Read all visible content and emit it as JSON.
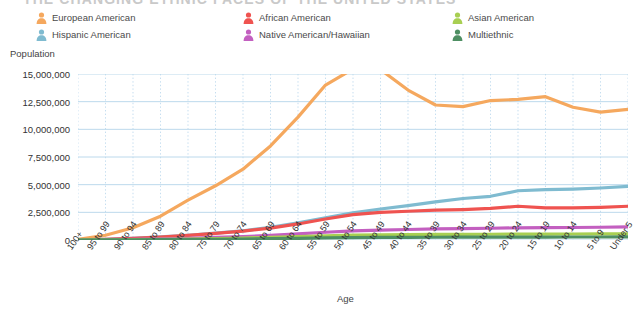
{
  "title": "THE CHANGING ETHNIC FACES OF THE UNITED STATES",
  "axis": {
    "y_title": "Population",
    "x_title": "Age"
  },
  "legend": {
    "icon_name": "person-icon",
    "columns": [
      [
        {
          "label": "European American",
          "color": "#F5A85E"
        },
        {
          "label": "Hispanic American",
          "color": "#7FBBD0"
        }
      ],
      [
        {
          "label": "African American",
          "color": "#EF5350"
        },
        {
          "label": "Native American/Hawaiian",
          "color": "#C35FC0"
        }
      ],
      [
        {
          "label": "Asian American",
          "color": "#A8CF52"
        },
        {
          "label": "Multiethnic",
          "color": "#4E8F63"
        }
      ]
    ]
  },
  "chart_data": {
    "type": "line",
    "title": "THE CHANGING ETHNIC FACES OF THE UNITED STATES",
    "xlabel": "Age",
    "ylabel": "Population",
    "ylim": [
      0,
      15000000
    ],
    "yticks": [
      0,
      2500000,
      5000000,
      7500000,
      10000000,
      12500000,
      15000000
    ],
    "ytick_labels": [
      "0",
      "2,500,000",
      "5,000,000",
      "7,500,000",
      "10,000,000",
      "12,500,000",
      "15,000,000"
    ],
    "grid": true,
    "legend_position": "top",
    "categories": [
      "100+",
      "95 to 99",
      "90 to 94",
      "85 to 89",
      "80 to 84",
      "75 to 79",
      "70 to 74",
      "65 to 69",
      "60 to 64",
      "55 to 59",
      "50 to 54",
      "45 to 49",
      "40 to 44",
      "35 to 39",
      "30 to 34",
      "25 to 29",
      "20 to 24",
      "15 to 19",
      "10 to 14",
      "5 to 9",
      "Under 5"
    ],
    "series": [
      {
        "name": "European American",
        "color": "#F5A85E",
        "values": [
          60000,
          430000,
          1100000,
          2150000,
          3600000,
          4900000,
          6400000,
          8500000,
          11100000,
          14000000,
          15450000,
          15400000,
          13550000,
          12200000,
          12050000,
          12600000,
          12700000,
          12950000,
          12000000,
          11550000,
          11800000
        ]
      },
      {
        "name": "Hispanic American",
        "color": "#7FBBD0",
        "values": [
          15000,
          70000,
          150000,
          280000,
          430000,
          620000,
          830000,
          1150000,
          1550000,
          2000000,
          2450000,
          2800000,
          3100000,
          3450000,
          3750000,
          3950000,
          4450000,
          4550000,
          4600000,
          4700000,
          4850000
        ]
      },
      {
        "name": "African American",
        "color": "#EF5350",
        "values": [
          12000,
          60000,
          140000,
          260000,
          420000,
          600000,
          800000,
          1080000,
          1450000,
          1900000,
          2300000,
          2500000,
          2600000,
          2700000,
          2750000,
          2850000,
          3050000,
          2900000,
          2900000,
          2950000,
          3050000
        ]
      },
      {
        "name": "Native American/Hawaiian",
        "color": "#C35FC0",
        "values": [
          6000,
          25000,
          55000,
          100000,
          160000,
          230000,
          310000,
          420000,
          560000,
          700000,
          830000,
          900000,
          950000,
          1000000,
          1020000,
          1060000,
          1100000,
          1120000,
          1130000,
          1150000,
          1180000
        ]
      },
      {
        "name": "Asian American",
        "color": "#A8CF52",
        "values": [
          3000,
          12000,
          28000,
          55000,
          90000,
          130000,
          180000,
          240000,
          310000,
          380000,
          440000,
          470000,
          490000,
          500000,
          510000,
          520000,
          530000,
          535000,
          540000,
          545000,
          550000
        ]
      },
      {
        "name": "Multiethnic",
        "color": "#4E8F63",
        "values": [
          1500,
          6000,
          14000,
          27000,
          45000,
          65000,
          90000,
          120000,
          155000,
          190000,
          220000,
          235000,
          245000,
          250000,
          255000,
          260000,
          265000,
          268000,
          270000,
          272000,
          275000
        ]
      }
    ]
  }
}
